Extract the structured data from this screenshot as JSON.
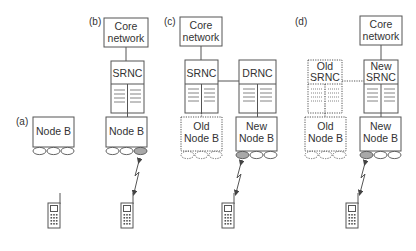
{
  "panels": {
    "a": {
      "label": "(a)",
      "node_b": [
        "Node B"
      ]
    },
    "b": {
      "label": "(b)",
      "core": [
        "Core",
        "network"
      ],
      "srnc": [
        "SRNC"
      ],
      "node_b": [
        "Node B"
      ]
    },
    "c": {
      "label": "(c)",
      "core": [
        "Core",
        "network"
      ],
      "srnc": [
        "SRNC"
      ],
      "drnc": [
        "DRNC"
      ],
      "old_node_b": [
        "Old",
        "Node B"
      ],
      "new_node_b": [
        "New",
        "Node B"
      ]
    },
    "d": {
      "label": "(d)",
      "core": [
        "Core",
        "network"
      ],
      "old_srnc": [
        "Old",
        "SRNC"
      ],
      "new_srnc": [
        "New",
        "SRNC"
      ],
      "old_node_b": [
        "Old",
        "Node B"
      ],
      "new_node_b": [
        "New",
        "Node B"
      ]
    }
  },
  "colors": {
    "stroke": "#555555",
    "text": "#333333",
    "active_cell": "#a8a8a8"
  }
}
